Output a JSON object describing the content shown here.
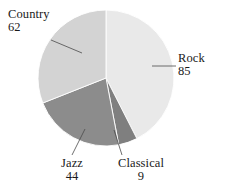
{
  "chart_data": {
    "type": "pie",
    "title": "",
    "subtitle": "",
    "xlabel": "",
    "ylabel": "",
    "grid": false,
    "legend": "none",
    "labels_position": "outside-with-leader-lines",
    "total": 200,
    "start_angle_deg": 0,
    "direction": "clockwise",
    "categories": [
      "Rock",
      "Classical",
      "Jazz",
      "Country"
    ],
    "values": [
      85,
      9,
      44,
      62
    ],
    "slices": [
      {
        "label": "Rock",
        "value": 85,
        "value_text": "85",
        "percent": 42.5,
        "angle_deg": 153.0,
        "start_deg": 0.0,
        "end_deg": 153.0,
        "color": "#e9e9e9"
      },
      {
        "label": "Classical",
        "value": 9,
        "value_text": "9",
        "percent": 4.5,
        "angle_deg": 16.2,
        "start_deg": 153.0,
        "end_deg": 169.2,
        "color": "#7f7f7f"
      },
      {
        "label": "Jazz",
        "value": 44,
        "value_text": "44",
        "percent": 22.0,
        "angle_deg": 79.2,
        "start_deg": 169.2,
        "end_deg": 248.4,
        "color": "#8c8c8c"
      },
      {
        "label": "Country",
        "value": 62,
        "value_text": "62",
        "percent": 31.0,
        "angle_deg": 111.6,
        "start_deg": 248.4,
        "end_deg": 360.0,
        "color": "#d3d3d3"
      }
    ],
    "colors": {
      "rock": "#e9e9e9",
      "classical": "#7f7f7f",
      "jazz": "#8c8c8c",
      "country": "#d3d3d3",
      "background": "#ffffff",
      "text": "#1a1a1a",
      "leader_line": "#4a4a4a"
    },
    "geometry": {
      "center_x": 106,
      "center_y": 78,
      "radius": 68
    }
  },
  "labels": {
    "country": {
      "name": "Country",
      "value": "62"
    },
    "rock": {
      "name": "Rock",
      "value": "85"
    },
    "jazz": {
      "name": "Jazz",
      "value": "44"
    },
    "classical": {
      "name": "Classical",
      "value": "9"
    }
  }
}
